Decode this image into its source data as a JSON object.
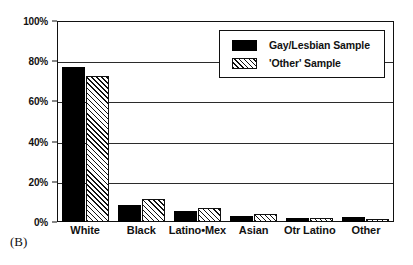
{
  "panel": {
    "label": "(B)"
  },
  "legend": {
    "position": "top-right-inset",
    "entries": [
      {
        "label": "Gay/Lesbian Sample",
        "swatch": "solid-black-swatch"
      },
      {
        "label": "'Other' Sample",
        "swatch": "diagonal-hatch-swatch"
      }
    ]
  },
  "chart_data": {
    "type": "bar",
    "title": "",
    "subtitle": "",
    "xlabel": "",
    "ylabel": "",
    "ylim": [
      0,
      100
    ],
    "yticks": [
      0,
      20,
      40,
      60,
      80,
      100
    ],
    "ytick_labels": [
      "0%",
      "20%",
      "40%",
      "60%",
      "80%",
      "100%"
    ],
    "grid": true,
    "grid_axis": "y",
    "legend_position": "upper right",
    "categories": [
      "White",
      "Black",
      "Latino•Mex",
      "Asian",
      "Otr Latino",
      "Other"
    ],
    "series": [
      {
        "name": "Gay/Lesbian Sample",
        "style": "solid-black",
        "values": [
          77,
          8.5,
          5.5,
          3,
          2,
          2.5
        ]
      },
      {
        "name": "'Other' Sample",
        "style": "diagonal-hatch",
        "values": [
          72.5,
          11.5,
          7,
          4,
          2,
          1.5
        ]
      }
    ],
    "units": "percent"
  },
  "colors": {
    "series_1": "#000000",
    "series_2_line": "#111111",
    "series_2_fill": "#ffffff",
    "frame": "#111111",
    "grid": "#2b2b2b",
    "background": "#ffffff"
  }
}
